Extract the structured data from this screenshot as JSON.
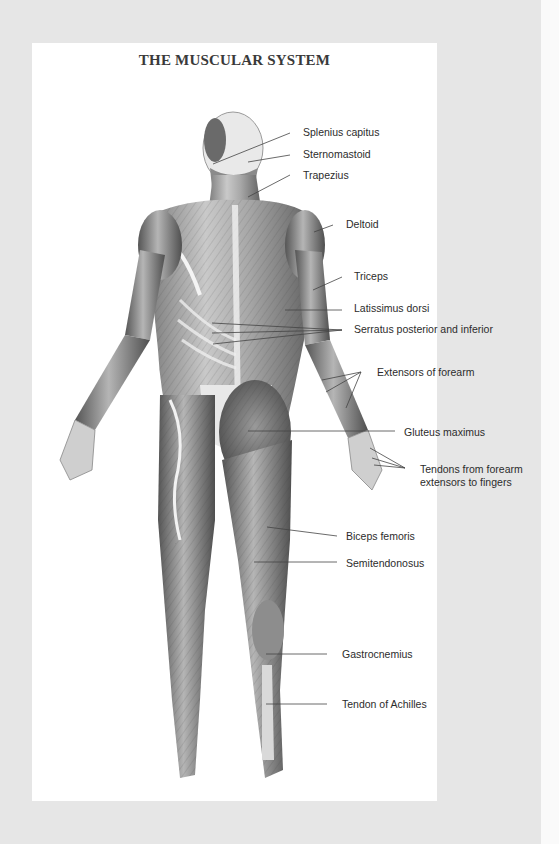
{
  "title": "THE MUSCULAR SYSTEM",
  "colors": {
    "background": "#e6e6e6",
    "page": "#ffffff",
    "text": "#2c2c2c",
    "leader_line": "#444444"
  },
  "labels": [
    {
      "id": "splenius-capitus",
      "text": "Splenius capitus",
      "x": 303,
      "y": 126
    },
    {
      "id": "sternomastoid",
      "text": "Sternomastoid",
      "x": 303,
      "y": 148
    },
    {
      "id": "trapezius",
      "text": "Trapezius",
      "x": 303,
      "y": 169
    },
    {
      "id": "deltoid",
      "text": "Deltoid",
      "x": 346,
      "y": 218
    },
    {
      "id": "triceps",
      "text": "Triceps",
      "x": 354,
      "y": 270
    },
    {
      "id": "latissimus-dorsi",
      "text": "Latissimus dorsi",
      "x": 354,
      "y": 302
    },
    {
      "id": "serratus",
      "text": "Serratus posterior and inferior",
      "x": 354,
      "y": 323
    },
    {
      "id": "extensors-forearm",
      "text": "Extensors of forearm",
      "x": 377,
      "y": 366
    },
    {
      "id": "gluteus-maximus",
      "text": "Gluteus maximus",
      "x": 404,
      "y": 426
    },
    {
      "id": "tendons-forearm",
      "text": "Tendons from forearm\nextensors to fingers",
      "line1": "Tendons from forearm",
      "line2": "extensors to fingers",
      "x": 420,
      "y": 463
    },
    {
      "id": "biceps-femoris",
      "text": "Biceps femoris",
      "x": 346,
      "y": 530
    },
    {
      "id": "semitendonosus",
      "text": "Semitendonosus",
      "x": 346,
      "y": 557
    },
    {
      "id": "gastrocnemius",
      "text": "Gastrocnemius",
      "x": 342,
      "y": 648
    },
    {
      "id": "tendon-achilles",
      "text": "Tendon of Achilles",
      "x": 342,
      "y": 698
    }
  ]
}
